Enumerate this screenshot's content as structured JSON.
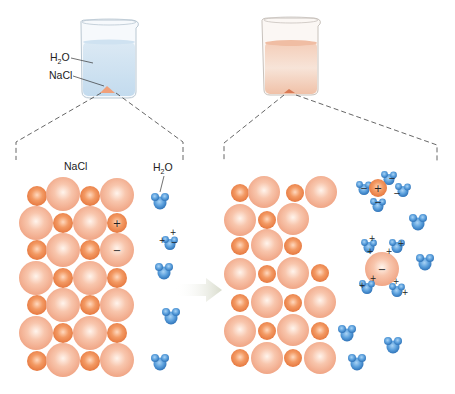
{
  "diagram": {
    "colors": {
      "na_ion": "#ee8a55",
      "cl_ion": "#f5b49a",
      "water": "#4a8fd0",
      "water_light": "#8fc1ec",
      "water_fill_left": "#d6e8f5",
      "water_fill_right": "#f2c4ae",
      "arrow": "#e4e6dc",
      "dash": "#555555"
    },
    "left_beaker": {
      "labels": {
        "water_main": "H",
        "water_sub": "2",
        "water_tail": "O",
        "salt": "NaCl"
      }
    },
    "left_panel": {
      "salt_label": "NaCl",
      "water_label_main": "H",
      "water_label_sub": "2",
      "water_label_tail": "O",
      "lattice_charges": {
        "cation": "+",
        "anion": "−"
      },
      "water_partial_charges": {
        "hydrogen": "+",
        "oxygen": "−"
      }
    },
    "transition_arrow": {
      "direction": "right"
    },
    "right_panel": {
      "hydrated_cation": {
        "ion": "+",
        "surrounding_water_charge": "−"
      },
      "hydrated_anion": {
        "ion": "−",
        "surrounding_water_charge": "+"
      }
    }
  }
}
